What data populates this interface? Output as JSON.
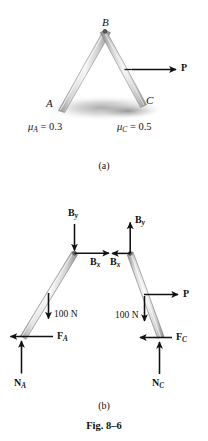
{
  "figure": {
    "number": "Fig. 8-6",
    "number_display": "Fig. 8–6",
    "caption_a": "(a)",
    "caption_b": "(b)"
  },
  "part_a": {
    "description": "Two leaning members pinned at top B resting on ground at A and C, with horizontal force P applied to right member",
    "points": [
      {
        "id": "A",
        "label": "A"
      },
      {
        "id": "B",
        "label": "B"
      },
      {
        "id": "C",
        "label": "C"
      }
    ],
    "friction": [
      {
        "symbol": "μ",
        "subscript": "A",
        "equals": "= 0.3",
        "full": "μ_A = 0.3"
      },
      {
        "symbol": "μ",
        "subscript": "C",
        "equals": "= 0.5",
        "full": "μ_C = 0.5"
      }
    ],
    "applied_force": {
      "label": "P",
      "direction": "right"
    }
  },
  "part_b": {
    "description": "Free body diagrams of the left member (A-B) and right member (B-C)",
    "left_member": {
      "forces": [
        {
          "name": "B-y-left",
          "label": "B",
          "subscript": "y",
          "direction": "down"
        },
        {
          "name": "B-x-left",
          "label": "B",
          "subscript": "x",
          "direction": "right"
        },
        {
          "name": "weight-left",
          "label": "100 N",
          "direction": "down"
        },
        {
          "name": "friction-A",
          "label": "F",
          "subscript": "A",
          "direction": "left"
        },
        {
          "name": "normal-A",
          "label": "N",
          "subscript": "A",
          "direction": "up"
        }
      ]
    },
    "right_member": {
      "forces": [
        {
          "name": "B-y-right",
          "label": "B",
          "subscript": "y",
          "direction": "up"
        },
        {
          "name": "B-x-right",
          "label": "B",
          "subscript": "x",
          "direction": "left"
        },
        {
          "name": "applied-P",
          "label": "P",
          "direction": "right"
        },
        {
          "name": "weight-right",
          "label": "100 N",
          "direction": "down"
        },
        {
          "name": "friction-C",
          "label": "F",
          "subscript": "C",
          "direction": "left"
        },
        {
          "name": "normal-C",
          "label": "N",
          "subscript": "C",
          "direction": "up"
        }
      ]
    }
  },
  "colors": {
    "ink": "#111111",
    "member_light": "#f2f2f2",
    "member_mid": "#cfcfcf",
    "member_dark": "#9a9a9a",
    "shadow": "#b8b8b8",
    "background": "#ffffff"
  }
}
